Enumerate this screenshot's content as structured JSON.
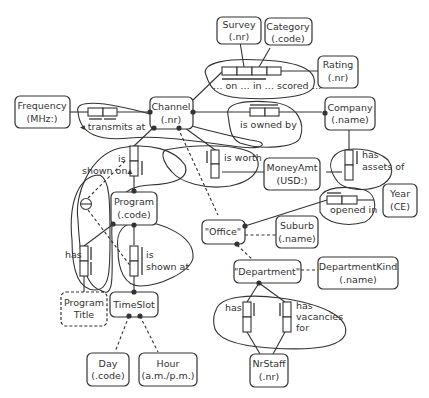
{
  "diagram": {
    "type": "ORM fact-type diagram",
    "entities": [
      {
        "id": "survey",
        "name": "Survey",
        "ref": "(.nr)"
      },
      {
        "id": "category",
        "name": "Category",
        "ref": "(.code)"
      },
      {
        "id": "rating",
        "name": "Rating",
        "ref": "(.nr)"
      },
      {
        "id": "frequency",
        "name": "Frequency",
        "ref": "(MHz:)"
      },
      {
        "id": "channel",
        "name": "Channel",
        "ref": "(.nr)"
      },
      {
        "id": "company",
        "name": "Company",
        "ref": "(.name)"
      },
      {
        "id": "moneyamt",
        "name": "MoneyAmt",
        "ref": "(USD:)"
      },
      {
        "id": "year",
        "name": "Year",
        "ref": "(CE)"
      },
      {
        "id": "program",
        "name": "Program",
        "ref": "(.code)"
      },
      {
        "id": "office",
        "name": "\"Office\"",
        "ref": ""
      },
      {
        "id": "suburb",
        "name": "Suburb",
        "ref": "(.name)"
      },
      {
        "id": "department",
        "name": "\"Department\"",
        "ref": ""
      },
      {
        "id": "departmentkind",
        "name": "DepartmentKind",
        "ref": "(.name)"
      },
      {
        "id": "programtitle",
        "name": "Program",
        "ref": "Title"
      },
      {
        "id": "timeslot",
        "name": "TimeSlot",
        "ref": ""
      },
      {
        "id": "day",
        "name": "Day",
        "ref": "(.code)"
      },
      {
        "id": "hour",
        "name": "Hour",
        "ref": "(a.m./p.m.)"
      },
      {
        "id": "nrstaff",
        "name": "NrStaff",
        "ref": "(.nr)"
      }
    ],
    "fact_types": [
      {
        "id": "scored",
        "reading": "… on … in … scored …"
      },
      {
        "id": "transmits",
        "reading": "◂ transmits at"
      },
      {
        "id": "owned",
        "reading": "is owned by"
      },
      {
        "id": "worth",
        "reading": "is worth"
      },
      {
        "id": "assets",
        "reading_1": "has",
        "reading_2": "assets of"
      },
      {
        "id": "shownon",
        "reading_1": "is",
        "reading_2": "shown on▴"
      },
      {
        "id": "opened",
        "reading": "opened in"
      },
      {
        "id": "title",
        "reading": "has"
      },
      {
        "id": "shownat",
        "reading_1": "is",
        "reading_2": "shown at"
      },
      {
        "id": "depthas",
        "reading": "has"
      },
      {
        "id": "vacancies",
        "reading_1": "has",
        "reading_2": "vacancies",
        "reading_3": "for"
      }
    ],
    "exclusion_symbol": "⊖"
  }
}
